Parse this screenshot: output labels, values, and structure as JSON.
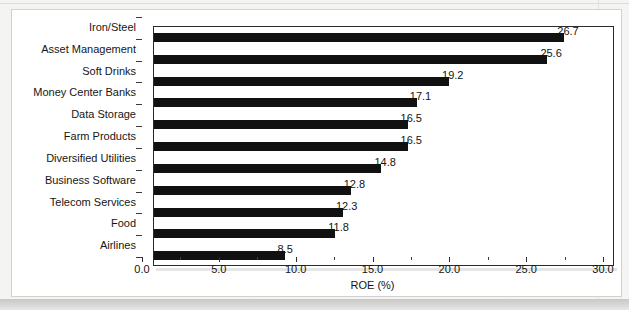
{
  "chart_data": {
    "type": "bar",
    "orientation": "horizontal",
    "title": "",
    "xlabel": "ROE (%)",
    "ylabel": "",
    "xlim": [
      0.0,
      30.0
    ],
    "xticks": [
      "0.0",
      "5.0",
      "10.0",
      "15.0",
      "20.0",
      "25.0",
      "30.0"
    ],
    "xtick_values": [
      0,
      5,
      10,
      15,
      20,
      25,
      30
    ],
    "minor_tick_interval": 2.5,
    "grid": false,
    "legend": null,
    "bar_color": "#111111",
    "categories": [
      "Iron/Steel",
      "Asset Management",
      "Soft Drinks",
      "Money Center Banks",
      "Data Storage",
      "Farm Products",
      "Diversified Utilities",
      "Business Software",
      "Telecom Services",
      "Food",
      "Airlines"
    ],
    "values": [
      26.7,
      25.6,
      19.2,
      17.1,
      16.5,
      16.5,
      14.8,
      12.8,
      12.3,
      11.8,
      8.5
    ],
    "value_labels": [
      "26.7",
      "25.6",
      "19.2",
      "17.1",
      "16.5",
      "16.5",
      "14.8",
      "12.8",
      "12.3",
      "11.8",
      "8.5"
    ]
  }
}
